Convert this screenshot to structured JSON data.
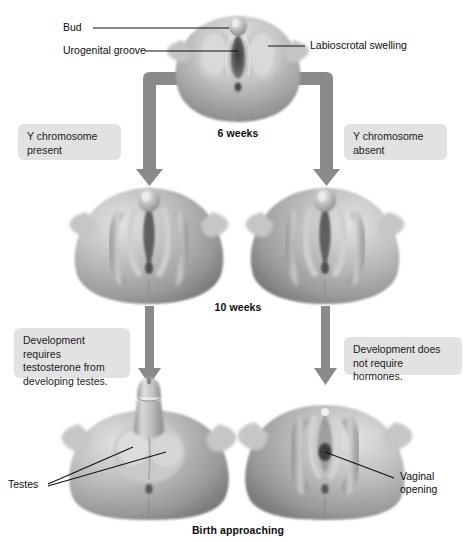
{
  "figure": {
    "width": 476,
    "height": 542,
    "background": "#ffffff"
  },
  "colors": {
    "callout_background": "#e2e2e2",
    "arrow_fill": "#8a8a8a",
    "leader_line": "#111111",
    "text": "#0d0d0d",
    "tissue_light": "#d8d8d8",
    "tissue_mid": "#aeaeae",
    "tissue_dark": "#8c8c8c",
    "tissue_shadow": "#6e6e6e"
  },
  "top_strip": {
    "cropped_title": ""
  },
  "annotations": {
    "bud": "Bud",
    "urogenital_groove": "Urogenital groove",
    "labioscrotal_swelling": "Labioscrotal  swelling",
    "testes": "Testes",
    "vaginal_opening": "Vaginal\nopening"
  },
  "stages": [
    {
      "id": "stage-6-weeks",
      "label": "6 weeks"
    },
    {
      "id": "stage-10-weeks",
      "label": "10 weeks"
    },
    {
      "id": "stage-birth",
      "label": "Birth approaching"
    }
  ],
  "callouts": [
    {
      "id": "y-chromosome-present",
      "text": "Y chromosome\npresent",
      "branch": "male"
    },
    {
      "id": "y-chromosome-absent",
      "text": "Y chromosome\nabsent",
      "branch": "female"
    },
    {
      "id": "development-requires-testosterone",
      "text": "Development requires\ntestosterone from\ndeveloping testes.",
      "branch": "male"
    },
    {
      "id": "development-no-hormones",
      "text": "Development does\nnot require hormones.",
      "branch": "female"
    }
  ],
  "specimens": [
    {
      "id": "indifferent-stage",
      "stage": "6 weeks",
      "sex": "indifferent"
    },
    {
      "id": "male-10-weeks",
      "stage": "10 weeks",
      "sex": "male"
    },
    {
      "id": "female-10-weeks",
      "stage": "10 weeks",
      "sex": "female"
    },
    {
      "id": "male-birth",
      "stage": "Birth approaching",
      "sex": "male"
    },
    {
      "id": "female-birth",
      "stage": "Birth approaching",
      "sex": "female"
    }
  ]
}
